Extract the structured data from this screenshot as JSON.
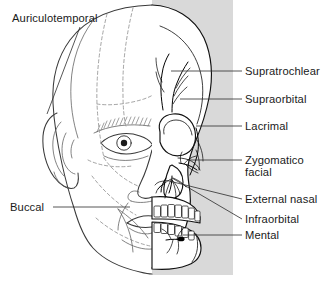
{
  "figure": {
    "panel": {
      "name": "gray-background-panel",
      "color": "#d9d9d9",
      "x": 152,
      "y": 0,
      "width": 81,
      "height": 275
    },
    "canvas": {
      "width": 326,
      "height": 289,
      "background": "#ffffff"
    }
  },
  "labels": {
    "left": [
      {
        "id": "auriculotemporal",
        "text": "Auriculotemporal",
        "x": 12,
        "y": 22,
        "anchor": "start"
      },
      {
        "id": "buccal",
        "text": "Buccal",
        "x": 10,
        "y": 211,
        "anchor": "start"
      }
    ],
    "right": [
      {
        "id": "supratrochlear",
        "text": "Supratrochlear",
        "x": 245,
        "y": 75,
        "anchor": "start"
      },
      {
        "id": "supraorbital",
        "text": "Supraorbital",
        "x": 245,
        "y": 103,
        "anchor": "start"
      },
      {
        "id": "lacrimal",
        "text": "Lacrimal",
        "x": 245,
        "y": 130,
        "anchor": "start"
      },
      {
        "id": "zygomatico",
        "text": "Zygomatico",
        "x": 245,
        "y": 164,
        "anchor": "start"
      },
      {
        "id": "facial",
        "text": "facial",
        "x": 245,
        "y": 176,
        "anchor": "start"
      },
      {
        "id": "external-nasal",
        "text": "External nasal",
        "x": 245,
        "y": 203,
        "anchor": "start"
      },
      {
        "id": "infraorbital",
        "text": "Infraorbital",
        "x": 245,
        "y": 223,
        "anchor": "start"
      },
      {
        "id": "mental",
        "text": "Mental",
        "x": 245,
        "y": 239,
        "anchor": "start"
      }
    ]
  },
  "nerves_listed": [
    "Auriculotemporal",
    "Buccal",
    "Supratrochlear",
    "Supraorbital",
    "Lacrimal",
    "Zygomaticofacial",
    "External nasal",
    "Infraorbital",
    "Mental"
  ],
  "colors": {
    "ink": "#111111",
    "label_text": "#1a1a1a",
    "leader": "#2b2b2b",
    "face_outline": "#3a3a3a",
    "dermatome_dash": "#8d8d8d",
    "panel_gray": "#d9d9d9"
  }
}
